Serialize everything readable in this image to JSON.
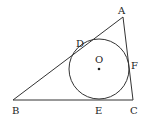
{
  "diagram": {
    "type": "geometry",
    "colors": {
      "stroke": "#333333",
      "label": "#222222",
      "background": "#ffffff"
    },
    "points": {
      "A": {
        "label": "A",
        "x": 123,
        "y": 17
      },
      "B": {
        "label": "B",
        "x": 13,
        "y": 100
      },
      "C": {
        "label": "C",
        "x": 133,
        "y": 100
      },
      "D": {
        "label": "D"
      },
      "E": {
        "label": "E"
      },
      "F": {
        "label": "F"
      },
      "O": {
        "label": "O",
        "x": 99,
        "y": 69
      }
    },
    "circle": {
      "center": "O",
      "radius": 30
    },
    "segments": [
      "AB",
      "BC",
      "CA"
    ]
  }
}
